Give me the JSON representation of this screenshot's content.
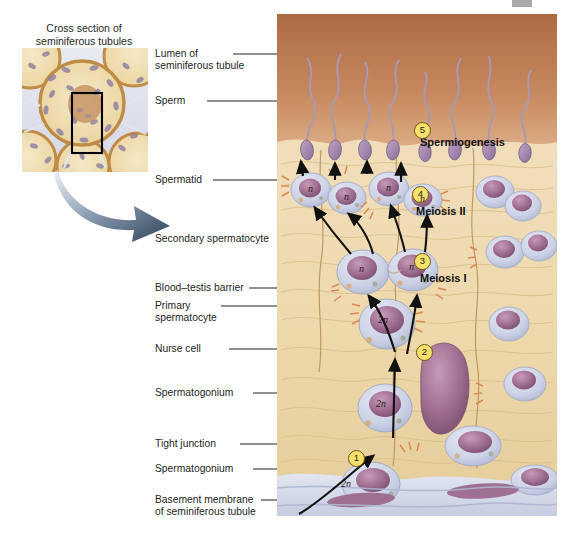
{
  "figure": {
    "domain": "biology-diagram"
  },
  "inset": {
    "title_line1": "Cross section of",
    "title_line2": "seminiferous tubules",
    "callout_arrow": "curved-arrow-to-detail",
    "highlight_box": "black-rectangle-region"
  },
  "labels": [
    {
      "id": "lumen",
      "line1": "Lumen of",
      "line2": "seminiferous tubule"
    },
    {
      "id": "sperm",
      "line1": "Sperm",
      "line2": ""
    },
    {
      "id": "spermatid",
      "line1": "Spermatid",
      "line2": ""
    },
    {
      "id": "secondary",
      "line1": "Secondary spermatocyte",
      "line2": ""
    },
    {
      "id": "barrier",
      "line1": "Blood–testis barrier",
      "line2": ""
    },
    {
      "id": "primary",
      "line1": "Primary",
      "line2": "spermatocyte"
    },
    {
      "id": "nurse",
      "line1": "Nurse cell",
      "line2": ""
    },
    {
      "id": "spermatogonium_upper",
      "line1": "Spermatogonium",
      "line2": ""
    },
    {
      "id": "tight",
      "line1": "Tight junction",
      "line2": ""
    },
    {
      "id": "spermatogonium_lower",
      "line1": "Spermatogonium",
      "line2": ""
    },
    {
      "id": "basement",
      "line1": "Basement membrane",
      "line2": "of seminiferous tubule"
    }
  ],
  "stages": [
    {
      "number": "1",
      "label": ""
    },
    {
      "number": "2",
      "label": ""
    },
    {
      "number": "3",
      "label": "Meiosis I"
    },
    {
      "number": "4",
      "label": "Meiosis II"
    },
    {
      "number": "5",
      "label": "Spermiogenesis"
    }
  ],
  "ploidy_marks": [
    {
      "id": "spermatogonium-lower",
      "text": "2n"
    },
    {
      "id": "spermatogonium-upper",
      "text": "2n"
    },
    {
      "id": "primary-spermatocyte",
      "text": "2n"
    },
    {
      "id": "secondary-left",
      "text": "n"
    },
    {
      "id": "secondary-right",
      "text": "n"
    },
    {
      "id": "spermatid-1",
      "text": "n"
    },
    {
      "id": "spermatid-2",
      "text": "n"
    },
    {
      "id": "spermatid-3",
      "text": "n"
    },
    {
      "id": "spermatid-4",
      "text": "n"
    }
  ],
  "colors": {
    "lumen_top": "#b5724a",
    "lumen_bottom": "#d9a277",
    "cytoplasm": "#ecd9a8",
    "cytoplasm_dark": "#dcc084",
    "nucleus": "#9c6a8c",
    "nucleus_light": "#b98bab",
    "cell_membrane": "#c3c8e0",
    "basement": "#ccd3e6",
    "badge": "#f7df6a",
    "badge_border": "#6b5a14",
    "tight_junction": "#d98a55",
    "text": "#231f20",
    "arrow": "#3d4d63"
  }
}
